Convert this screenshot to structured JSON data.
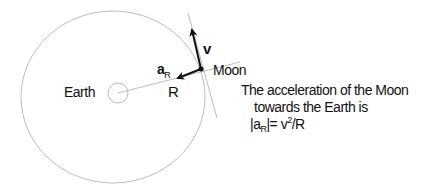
{
  "labels": {
    "earth": "Earth",
    "moon": "Moon",
    "radius": "R",
    "velocity": "v",
    "accel_symbol": "a",
    "accel_sub": "R"
  },
  "caption": {
    "line1": "The acceleration of the Moon",
    "line2": "towards the Earth is",
    "formula_prefix": "|a",
    "formula_sub": "R",
    "formula_mid": "|= v",
    "formula_sup": "2",
    "formula_end": "/R"
  },
  "colors": {
    "orbit": "#bdbdbd",
    "arrow": "#111111",
    "text": "#111111"
  }
}
